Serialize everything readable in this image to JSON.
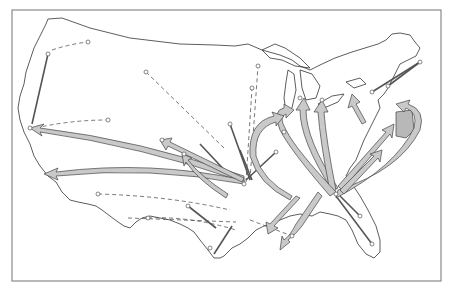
{
  "map": {
    "type": "flow-map",
    "region": "United States (contiguous)",
    "style": "black-and-white scanned figure",
    "colors": {
      "background": "#ffffff",
      "outline": "#333333",
      "arrow_fill": "#c9c9c9",
      "arrow_stroke": "#444444",
      "frame": "#8a8a8a"
    },
    "legend": null,
    "title": null,
    "labels": []
  }
}
